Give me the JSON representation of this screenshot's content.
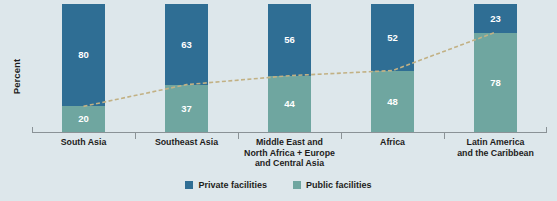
{
  "chart_data": {
    "type": "bar",
    "subtype": "stacked-bar-100",
    "title": "",
    "xlabel": "",
    "ylabel": "Percent",
    "ylim": [
      0,
      100
    ],
    "grid": false,
    "legend_position": "bottom",
    "categories": [
      "South Asia",
      "Southeast Asia",
      "Middle East and North Africa + Europe and Central Asia",
      "Africa",
      "Latin America and the Caribbean"
    ],
    "category_lines": [
      [
        "South Asia"
      ],
      [
        "Southeast Asia"
      ],
      [
        "Middle East and",
        "North Africa + Europe",
        "and Central Asia"
      ],
      [
        "Africa"
      ],
      [
        "Latin America",
        "and the Caribbean"
      ]
    ],
    "series": [
      {
        "name": "Private facilities",
        "color": "#2f6e94",
        "values": [
          80,
          63,
          56,
          52,
          23
        ]
      },
      {
        "name": "Public facilities",
        "color": "#6fa6a0",
        "values": [
          20,
          37,
          44,
          48,
          78
        ]
      }
    ],
    "overlay_line": {
      "name": "public-share-trend",
      "style": "dashed",
      "color": "#c2b184",
      "values": [
        20,
        37,
        44,
        48,
        78
      ]
    },
    "annotations": {
      "bar_labels_private": [
        "80",
        "63",
        "56",
        "52",
        "23"
      ],
      "bar_labels_public": [
        "20",
        "37",
        "44",
        "48",
        "78"
      ]
    }
  },
  "legend": {
    "items": [
      {
        "label": "Private facilities",
        "color": "#2f6e94"
      },
      {
        "label": "Public facilities",
        "color": "#6fa6a0"
      }
    ]
  },
  "colors": {
    "background": "#dde7eb",
    "private": "#2f6e94",
    "public": "#6fa6a0",
    "trend_line": "#c2b184",
    "axis": "#8a9296",
    "text": "#1d1d1b",
    "bar_label_text": "#ffffff"
  },
  "axis": {
    "y_label": "Percent"
  }
}
